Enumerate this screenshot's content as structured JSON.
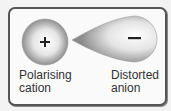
{
  "diagram": {
    "cation": {
      "symbol": "+",
      "label_line1": "Polarising",
      "label_line2": "cation"
    },
    "anion": {
      "symbol": "−",
      "label_line1": "Distorted",
      "label_line2": "anion"
    },
    "colors": {
      "frame_border": "#555555",
      "background": "#fafafa",
      "sphere_light": "#ffffff",
      "sphere_dark": "#8c8c8c",
      "symbol": "#222222",
      "text": "#333333"
    }
  }
}
